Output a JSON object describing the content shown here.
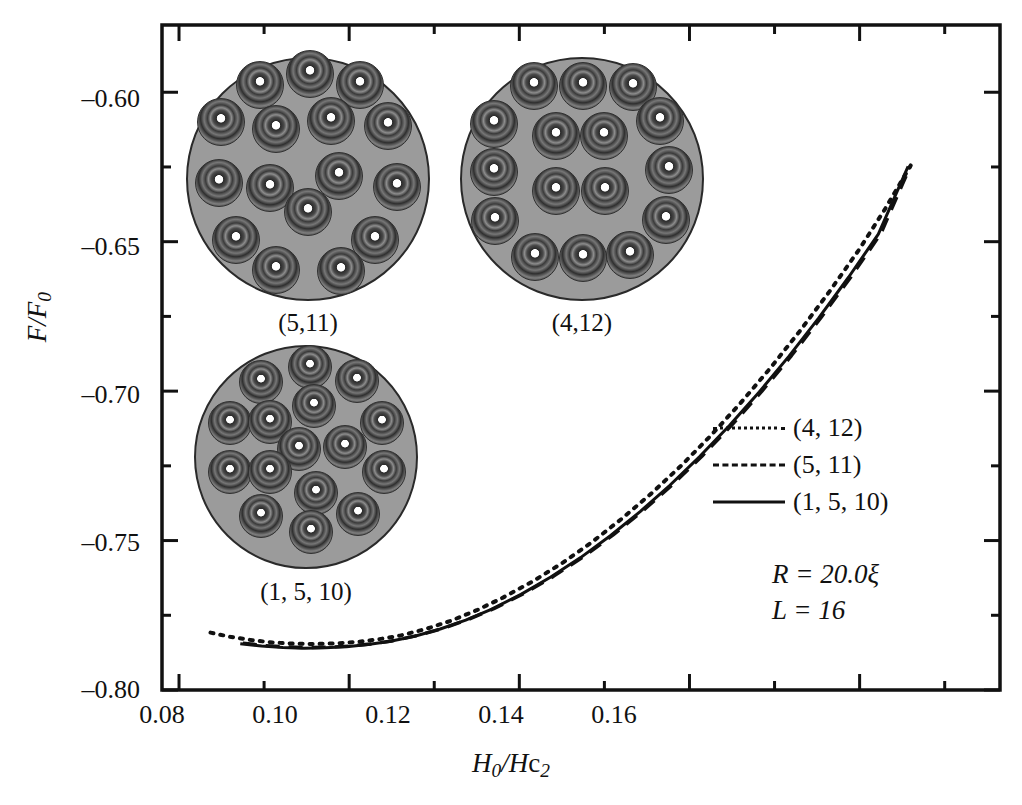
{
  "figure": {
    "background_color": "#ffffff",
    "frame_color": "#111111"
  },
  "axes": {
    "x_title": "H0/Hc2",
    "y_title": "F/F0",
    "x_ticks": [
      "0.08",
      "0.10",
      "0.12",
      "0.14",
      "0.16"
    ],
    "y_ticks": [
      "–0.60",
      "–0.65",
      "–0.70",
      "–0.75",
      "–0.80"
    ]
  },
  "legend": {
    "entries": [
      {
        "style": "dotted",
        "label": "(4, 12)"
      },
      {
        "style": "dashed",
        "label": "(5, 11)"
      },
      {
        "style": "solid",
        "label": "(1, 5, 10)"
      }
    ]
  },
  "annotations": {
    "radius": "R = 20.0ξ",
    "vorticity": "L = 16"
  },
  "insets": [
    {
      "caption": "(5,11)",
      "left": 186,
      "top": 57,
      "size": 244,
      "caption_top": 252,
      "vortices": [
        {
          "x": 50.0,
          "y": 6.0
        },
        {
          "x": 29.5,
          "y": 10.5
        },
        {
          "x": 70.5,
          "y": 10.5
        },
        {
          "x": 13.5,
          "y": 26.0
        },
        {
          "x": 36.0,
          "y": 28.5
        },
        {
          "x": 58.5,
          "y": 25.5
        },
        {
          "x": 82.0,
          "y": 27.5
        },
        {
          "x": 12.5,
          "y": 51.0
        },
        {
          "x": 33.5,
          "y": 53.0
        },
        {
          "x": 62.0,
          "y": 48.0
        },
        {
          "x": 85.5,
          "y": 52.5
        },
        {
          "x": 49.0,
          "y": 62.5
        },
        {
          "x": 19.5,
          "y": 74.0
        },
        {
          "x": 76.5,
          "y": 74.0
        },
        {
          "x": 36.0,
          "y": 86.5
        },
        {
          "x": 62.5,
          "y": 87.0
        }
      ]
    },
    {
      "caption": "(4,12)",
      "left": 460,
      "top": 57,
      "size": 244,
      "caption_top": 252,
      "vortices": [
        {
          "x": 29.5,
          "y": 11.0
        },
        {
          "x": 49.5,
          "y": 11.0
        },
        {
          "x": 70.0,
          "y": 11.5
        },
        {
          "x": 13.0,
          "y": 26.5
        },
        {
          "x": 38.5,
          "y": 31.5
        },
        {
          "x": 58.0,
          "y": 31.5
        },
        {
          "x": 81.0,
          "y": 25.5
        },
        {
          "x": 13.0,
          "y": 46.5
        },
        {
          "x": 85.0,
          "y": 45.5
        },
        {
          "x": 38.5,
          "y": 54.0
        },
        {
          "x": 58.5,
          "y": 54.0
        },
        {
          "x": 13.5,
          "y": 66.5
        },
        {
          "x": 83.5,
          "y": 66.0
        },
        {
          "x": 30.0,
          "y": 81.0
        },
        {
          "x": 49.5,
          "y": 81.5
        },
        {
          "x": 69.0,
          "y": 80.5
        }
      ]
    },
    {
      "caption": "(1, 5, 10)",
      "left": 194,
      "top": 345,
      "size": 224,
      "caption_top": 233,
      "vortices": [
        {
          "x": 51.0,
          "y": 9.0
        },
        {
          "x": 29.0,
          "y": 15.5
        },
        {
          "x": 72.0,
          "y": 15.0
        },
        {
          "x": 52.5,
          "y": 26.5
        },
        {
          "x": 15.0,
          "y": 34.0
        },
        {
          "x": 33.0,
          "y": 33.5
        },
        {
          "x": 83.0,
          "y": 34.0
        },
        {
          "x": 46.0,
          "y": 45.5
        },
        {
          "x": 66.5,
          "y": 44.5
        },
        {
          "x": 15.0,
          "y": 56.0
        },
        {
          "x": 33.0,
          "y": 56.0
        },
        {
          "x": 84.0,
          "y": 56.0
        },
        {
          "x": 53.5,
          "y": 65.0
        },
        {
          "x": 29.0,
          "y": 75.5
        },
        {
          "x": 72.5,
          "y": 74.5
        },
        {
          "x": 51.5,
          "y": 82.5
        }
      ]
    }
  ],
  "chart_data": {
    "type": "line",
    "title": "",
    "xlabel": "H0/Hc2",
    "ylabel": "F/F0",
    "xlim": [
      0.078,
      0.1765
    ],
    "ylim": [
      -0.8,
      -0.5775
    ],
    "grid": false,
    "legend_position": "right-middle",
    "x_major_ticks": [
      0.08,
      0.1,
      0.12,
      0.14,
      0.16
    ],
    "y_major_ticks": [
      -0.8,
      -0.75,
      -0.7,
      -0.65,
      -0.6
    ],
    "x_minor_ticks": [
      0.09,
      0.11,
      0.13,
      0.15,
      0.17
    ],
    "y_minor_ticks": [
      -0.775,
      -0.725,
      -0.675,
      -0.625
    ],
    "annotations": [
      "R = 20.0ξ",
      "L = 16"
    ],
    "series": [
      {
        "name": "(4, 12)",
        "style": "dotted",
        "color": "#111111",
        "x": [
          0.0837,
          0.086,
          0.0885,
          0.091,
          0.0935,
          0.096,
          0.0985,
          0.101,
          0.1035,
          0.106,
          0.109,
          0.112,
          0.115,
          0.118,
          0.1215,
          0.125,
          0.1285,
          0.132,
          0.1355,
          0.139,
          0.1425,
          0.146,
          0.1495,
          0.153,
          0.1565,
          0.16,
          0.163,
          0.166
        ],
        "y": [
          -0.7808,
          -0.7822,
          -0.7833,
          -0.7841,
          -0.7845,
          -0.7846,
          -0.7844,
          -0.7839,
          -0.783,
          -0.7818,
          -0.7796,
          -0.7768,
          -0.7733,
          -0.7692,
          -0.7638,
          -0.7576,
          -0.7506,
          -0.7428,
          -0.7343,
          -0.725,
          -0.7149,
          -0.704,
          -0.6923,
          -0.6798,
          -0.6665,
          -0.6524,
          -0.639,
          -0.6245
        ]
      },
      {
        "name": "(5, 11)",
        "style": "dashed",
        "color": "#111111",
        "x": [
          0.0875,
          0.09,
          0.0925,
          0.095,
          0.0975,
          0.1,
          0.1025,
          0.105,
          0.108,
          0.111,
          0.114,
          0.117,
          0.1205,
          0.124,
          0.1275,
          0.131,
          0.1345,
          0.138,
          0.1415,
          0.145,
          0.1485,
          0.152,
          0.1555,
          0.159,
          0.1625,
          0.166
        ],
        "y": [
          -0.7843,
          -0.7851,
          -0.7856,
          -0.7858,
          -0.7857,
          -0.7853,
          -0.7846,
          -0.7836,
          -0.7818,
          -0.7794,
          -0.7764,
          -0.7728,
          -0.7678,
          -0.762,
          -0.7555,
          -0.7482,
          -0.7401,
          -0.7313,
          -0.7217,
          -0.7113,
          -0.7001,
          -0.6881,
          -0.6753,
          -0.6617,
          -0.6473,
          -0.6245
        ]
      },
      {
        "name": "(1, 5, 10)",
        "style": "solid",
        "color": "#111111",
        "x": [
          0.0872,
          0.0897,
          0.0922,
          0.0947,
          0.0972,
          0.0997,
          0.1022,
          0.1047,
          0.1077,
          0.1107,
          0.1137,
          0.1167,
          0.1202,
          0.1237,
          0.1272,
          0.1307,
          0.1342,
          0.1377,
          0.1412,
          0.1447,
          0.1482,
          0.1517,
          0.1552,
          0.1587,
          0.1622,
          0.1657
        ],
        "y": [
          -0.7845,
          -0.7853,
          -0.7858,
          -0.786,
          -0.7859,
          -0.7855,
          -0.7848,
          -0.7838,
          -0.782,
          -0.7796,
          -0.7766,
          -0.773,
          -0.768,
          -0.7622,
          -0.7557,
          -0.7484,
          -0.7403,
          -0.7315,
          -0.7219,
          -0.7115,
          -0.7003,
          -0.6883,
          -0.6755,
          -0.6619,
          -0.6475,
          -0.6248
        ]
      }
    ]
  }
}
